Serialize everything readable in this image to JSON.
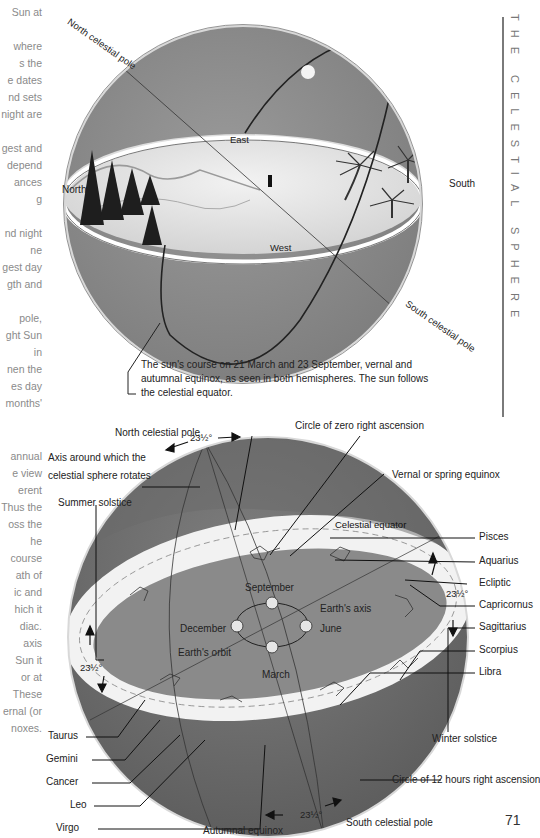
{
  "running_head": "THE CELESTIAL SPHERE",
  "page_number": "71",
  "margin_text_top": [
    "Sun at",
    "",
    "where",
    "s the",
    "e dates",
    "nd sets",
    "night are",
    "",
    "gest and",
    "depend",
    "ances",
    "g",
    "",
    "nd night",
    "ne",
    "gest day",
    "gth and",
    "",
    "pole,",
    "ght Sun",
    "in",
    "nen the",
    "es day",
    "months'"
  ],
  "margin_text_bottom": [
    "annual",
    "e view",
    "erent",
    "Thus the",
    "oss the",
    "he",
    "course",
    "ath of",
    "ic and",
    "hich it",
    "diac.",
    "axis",
    "Sun it",
    "or at",
    "These",
    "ernal (or",
    "noxes."
  ],
  "figure_top": {
    "labels": {
      "north_celestial_pole": "North celestial pole",
      "south_celestial_pole": "South celestial pole",
      "east": "East",
      "west": "West",
      "north": "North",
      "south": "South"
    },
    "caption": [
      "The sun's course on 21 March and 23 September, vernal and",
      "autumnal equinox, as seen in both hemispheres. The sun follows",
      "the celestial equator."
    ]
  },
  "figure_bottom": {
    "labels": {
      "north_celestial_pole": "North celestial pole",
      "axis_line1": "Axis around which the",
      "axis_line2": "celestial sphere rotates",
      "summer_solstice": "Summer solstice",
      "circle_zero_ra": "Circle of zero right ascension",
      "vernal_equinox": "Vernal or spring equinox",
      "celestial_equator": "Celestial equator",
      "september": "September",
      "december": "December",
      "june": "June",
      "march": "March",
      "earths_axis": "Earth's axis",
      "earths_orbit": "Earth's orbit",
      "winter_solstice": "Winter solstice",
      "circle_12h_ra": "Circle of 12 hours right ascension",
      "autumnal_equinox": "Autumnal equinox",
      "south_celestial_pole": "South celestial pole",
      "tilt_top": "23½°",
      "tilt_left": "23½°",
      "tilt_right": "23½°",
      "tilt_bottom": "23½°"
    },
    "zodiac_right": [
      "Pisces",
      "Aquarius",
      "Ecliptic",
      "Capricornus",
      "Sagittarius",
      "Scorpius",
      "Libra"
    ],
    "zodiac_left": [
      "Taurus",
      "Gemini",
      "Cancer",
      "Leo",
      "Virgo"
    ]
  }
}
